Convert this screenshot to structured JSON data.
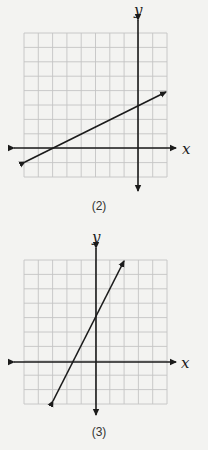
{
  "graphs": [
    {
      "caption": "(2)",
      "x_label": "x",
      "y_label": "y",
      "grid": {
        "x_min": -8,
        "x_max": 2,
        "y_min": -2,
        "y_max": 8
      },
      "line": {
        "from": [
          -8,
          -1
        ],
        "to": [
          2,
          4
        ],
        "equation": "y = 0.5x + 3"
      }
    },
    {
      "caption": "(3)",
      "x_label": "x",
      "y_label": "y",
      "grid": {
        "x_min": -5,
        "x_max": 5,
        "y_min": -3,
        "y_max": 7
      },
      "line": {
        "from": [
          -3,
          -3
        ],
        "to": [
          2,
          7
        ],
        "equation": "y = 2x + 3"
      }
    }
  ],
  "chart_data": [
    {
      "type": "line",
      "title": "(2)",
      "xlabel": "x",
      "ylabel": "y",
      "xlim": [
        -8,
        2
      ],
      "ylim": [
        -2,
        8
      ],
      "grid": true,
      "series": [
        {
          "name": "line",
          "x": [
            -8,
            2
          ],
          "y": [
            -1,
            4
          ]
        }
      ]
    },
    {
      "type": "line",
      "title": "(3)",
      "xlabel": "x",
      "ylabel": "y",
      "xlim": [
        -5,
        5
      ],
      "ylim": [
        -3,
        7
      ],
      "grid": true,
      "series": [
        {
          "name": "line",
          "x": [
            -3,
            2
          ],
          "y": [
            -3,
            7
          ]
        }
      ]
    }
  ]
}
